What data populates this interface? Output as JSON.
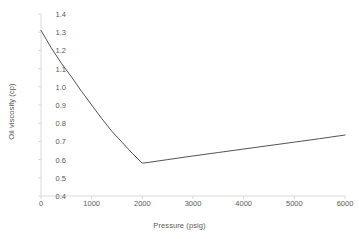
{
  "chart_data": {
    "type": "line",
    "title": "",
    "xlabel": "Pressure (psig)",
    "ylabel": "Oil viscosity (cp)",
    "xlim": [
      0,
      6000
    ],
    "ylim": [
      0.4,
      1.4
    ],
    "xticks": [
      0,
      1000,
      2000,
      3000,
      4000,
      5000,
      6000
    ],
    "xtick_labels": [
      "0",
      "1000",
      "2000",
      "3000",
      "4000",
      "5000",
      "6000"
    ],
    "yticks": [
      0.4,
      0.5,
      0.6,
      0.7,
      0.8,
      0.9,
      1.0,
      1.1,
      1.2,
      1.3,
      1.4
    ],
    "ytick_labels": [
      "0.4",
      "0.5",
      "0.6",
      "0.7",
      "0.8",
      "0.9",
      "1.0",
      "1.1",
      "1.2",
      "1.3",
      "1.4"
    ],
    "grid": false,
    "legend": false,
    "series": [
      {
        "name": "Oil viscosity",
        "color": "#404040",
        "x": [
          0,
          200,
          400,
          600,
          800,
          1000,
          1200,
          1400,
          1600,
          1800,
          2000,
          2500,
          3000,
          3500,
          4000,
          4500,
          5000,
          5500,
          6000
        ],
        "values": [
          1.31,
          1.215,
          1.13,
          1.055,
          0.975,
          0.9,
          0.825,
          0.755,
          0.695,
          0.635,
          0.58,
          0.6,
          0.62,
          0.639,
          0.658,
          0.677,
          0.696,
          0.715,
          0.735
        ]
      }
    ],
    "annotations": [
      {
        "label": "minimum (bubble point)",
        "x": 2000,
        "y": 0.58
      }
    ]
  },
  "style": {
    "line_color": "#404040",
    "axis_color": "#d9d9d9",
    "text_color": "#595959",
    "background": "#ffffff"
  }
}
